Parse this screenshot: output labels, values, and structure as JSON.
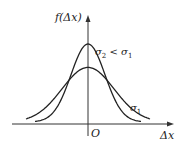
{
  "chart_data": {
    "type": "line",
    "title": "",
    "xlabel": "Δx",
    "ylabel": "f(Δx)",
    "origin_label": "O",
    "grid": false,
    "legend": "inline annotations",
    "series": [
      {
        "name": "σ2 < σ1",
        "label_main": "σ",
        "label_sub": "2",
        "label_rest": " < σ",
        "label_rest_sub": "1",
        "sigma": 0.7,
        "peak_relative": 1.0,
        "description": "narrow, taller normal curve"
      },
      {
        "name": "σ1",
        "label_main": "σ",
        "label_sub": "1",
        "sigma": 1.0,
        "peak_relative": 0.7,
        "description": "wide, shorter normal curve"
      }
    ],
    "annotations": [
      "σ2 < σ1",
      "σ1"
    ]
  },
  "labels": {
    "yaxis": "f(Δx)",
    "xaxis": "Δx",
    "origin": "O",
    "sigma_sym": "σ",
    "sub1": "1",
    "sub2": "2",
    "lt": " < "
  },
  "colors": {
    "curve": "#222222",
    "axis": "#333333",
    "background": "#ffffff"
  }
}
